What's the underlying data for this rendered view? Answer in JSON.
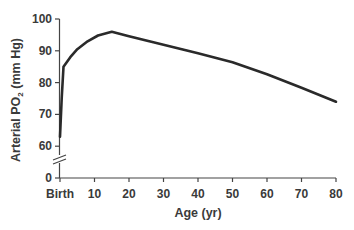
{
  "chart_data": {
    "type": "line",
    "title": "",
    "xlabel": "Age (yr)",
    "ylabel": "Arterial PO2 (mm Hg)",
    "ylabel_main": "Arterial PO",
    "ylabel_sub": "2",
    "ylabel_unit": " (mm Hg)",
    "x_tick_labels": [
      "Birth",
      "10",
      "20",
      "30",
      "40",
      "50",
      "60",
      "70",
      "80"
    ],
    "y_tick_labels": [
      "0",
      "60",
      "70",
      "80",
      "90",
      "100"
    ],
    "xlim": [
      0,
      80
    ],
    "ylim": [
      60,
      100
    ],
    "y_axis_break": true,
    "grid": false,
    "legend": null,
    "series": [
      {
        "name": "Arterial PO2",
        "color": "#2a2a2a",
        "x": [
          0,
          0.5,
          1,
          3,
          5,
          8,
          11,
          15,
          20,
          30,
          40,
          50,
          60,
          70,
          80
        ],
        "values": [
          63,
          75,
          85,
          88,
          90.5,
          93,
          94.8,
          96,
          94.6,
          91.9,
          89.2,
          86.4,
          82.6,
          78.4,
          74
        ]
      }
    ]
  }
}
